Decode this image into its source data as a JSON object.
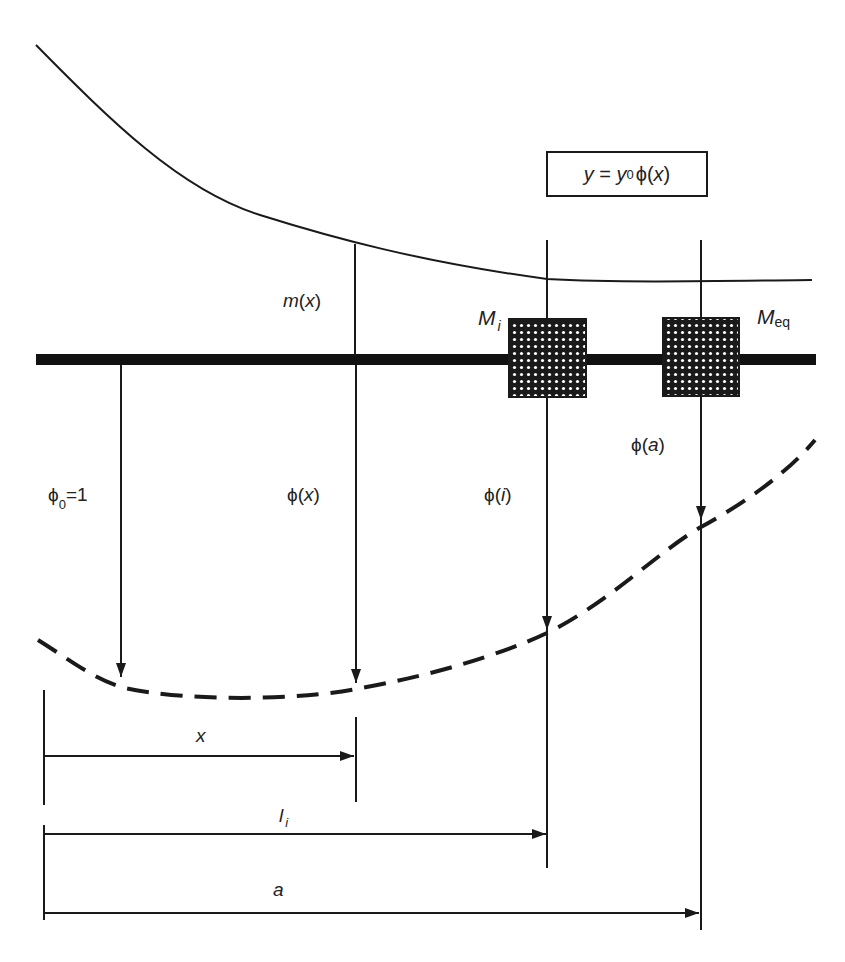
{
  "diagram": {
    "title_formula": {
      "lhs": "y",
      "eq": " = ",
      "y_sym": "y",
      "y_sub": "0",
      "phi": "ϕ",
      "arg_open": "(",
      "arg": "x",
      "arg_close": ")"
    },
    "labels": {
      "mass_distribution": {
        "main": "m",
        "open": "(",
        "arg": "x",
        "close": ")"
      },
      "mass_i": {
        "main": "M",
        "sub": "i"
      },
      "mass_eq": {
        "main": "M",
        "sub": "eq"
      },
      "phi0": {
        "main": "ϕ",
        "sub": "0",
        "rest": "=1"
      },
      "phi_x": {
        "main": "ϕ",
        "open": "(",
        "arg": "x",
        "close": ")"
      },
      "phi_i": {
        "main": "ϕ",
        "open": "(",
        "arg": "i",
        "close": ")"
      },
      "phi_a": {
        "main": "ϕ",
        "open": "(",
        "arg": "a",
        "close": ")"
      },
      "dim_x": "x",
      "dim_li": {
        "main": "l",
        "sub": "i"
      },
      "dim_a": "a"
    },
    "colors": {
      "ink": "#1a1a1a",
      "beam": "#111111",
      "mass_fill": "#1a1a1a",
      "mass_dots": "#ffffff",
      "background": "#ffffff"
    }
  }
}
